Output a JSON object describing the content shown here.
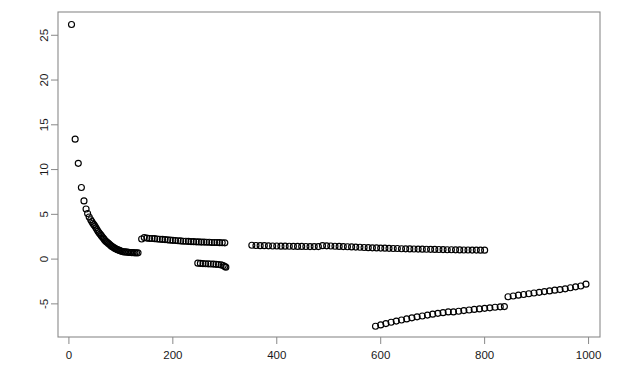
{
  "chart_data": {
    "type": "scatter",
    "title": "",
    "subtitle": "",
    "xlabel": "",
    "ylabel": "",
    "xlim": [
      -21,
      1022
    ],
    "ylim": [
      -8.7,
      27.6
    ],
    "grid": false,
    "legend": null,
    "legend_position": "none",
    "point_style": "open-circle",
    "point_color": "#000000",
    "background_color": "#ffffff",
    "frame_color": "#8a8a8a",
    "xticks": [
      0,
      200,
      400,
      600,
      800,
      1000
    ],
    "xtick_labels": [
      "0",
      "200",
      "400",
      "600",
      "800",
      "1000"
    ],
    "yticks": [
      -5,
      0,
      5,
      10,
      15,
      20,
      25
    ],
    "ytick_labels": [
      "-5",
      "0",
      "5",
      "10",
      "15",
      "20",
      "25"
    ],
    "ytick_label_rotation": -90,
    "series": [
      {
        "name": "decay-branch",
        "x": [
          5,
          12,
          18,
          24,
          29,
          33,
          36,
          39,
          42,
          44,
          46,
          48,
          50,
          52,
          54,
          56,
          58,
          60,
          62,
          64,
          66,
          68,
          70,
          72,
          74,
          76,
          78,
          80,
          82,
          84,
          86,
          88,
          90,
          92,
          94,
          96,
          98,
          100,
          103,
          106,
          109,
          112,
          115,
          118,
          121,
          124,
          127,
          130,
          133
        ],
        "y": [
          26.2,
          13.4,
          10.7,
          8.0,
          6.5,
          5.6,
          5.1,
          4.7,
          4.4,
          4.2,
          4.0,
          3.85,
          3.7,
          3.5,
          3.3,
          3.1,
          2.95,
          2.8,
          2.65,
          2.5,
          2.35,
          2.2,
          2.05,
          1.95,
          1.85,
          1.75,
          1.65,
          1.55,
          1.45,
          1.38,
          1.3,
          1.22,
          1.15,
          1.1,
          1.05,
          1.0,
          0.95,
          0.9,
          0.85,
          0.8,
          0.8,
          0.78,
          0.76,
          0.74,
          0.72,
          0.72,
          0.7,
          0.7,
          0.7
        ]
      },
      {
        "name": "upper-band-mid",
        "x": [
          140,
          145,
          150,
          155,
          160,
          165,
          170,
          175,
          180,
          185,
          190,
          195,
          200,
          205,
          210,
          215,
          220,
          225,
          230,
          235,
          240,
          245,
          250,
          255,
          260,
          265,
          270,
          275,
          280,
          285,
          290,
          295,
          300
        ],
        "y": [
          2.25,
          2.4,
          2.35,
          2.3,
          2.3,
          2.28,
          2.25,
          2.22,
          2.2,
          2.18,
          2.15,
          2.12,
          2.1,
          2.08,
          2.05,
          2.03,
          2.0,
          2.0,
          1.98,
          1.96,
          1.95,
          1.93,
          1.92,
          1.9,
          1.9,
          1.88,
          1.88,
          1.86,
          1.85,
          1.85,
          1.84,
          1.83,
          1.82
        ]
      },
      {
        "name": "dip-segment",
        "x": [
          248,
          253,
          258,
          263,
          268,
          273,
          278,
          283,
          288,
          293,
          297,
          300,
          302
        ],
        "y": [
          -0.45,
          -0.48,
          -0.5,
          -0.52,
          -0.53,
          -0.55,
          -0.56,
          -0.58,
          -0.6,
          -0.65,
          -0.72,
          -0.82,
          -0.9
        ]
      },
      {
        "name": "long-band-right",
        "x": [
          352,
          360,
          368,
          376,
          384,
          392,
          400,
          408,
          416,
          424,
          432,
          440,
          448,
          456,
          464,
          472,
          480,
          488,
          496,
          504,
          512,
          520,
          528,
          536,
          544,
          552,
          560,
          568,
          576,
          584,
          592,
          600,
          608,
          616,
          624,
          632,
          640,
          648,
          656,
          664,
          672,
          680,
          688,
          696,
          704,
          712,
          720,
          728,
          736,
          744,
          752,
          760,
          768,
          776,
          784,
          792,
          800
        ],
        "y": [
          1.55,
          1.52,
          1.5,
          1.5,
          1.48,
          1.47,
          1.46,
          1.45,
          1.45,
          1.44,
          1.43,
          1.42,
          1.42,
          1.41,
          1.4,
          1.4,
          1.4,
          1.5,
          1.48,
          1.46,
          1.44,
          1.42,
          1.4,
          1.38,
          1.36,
          1.34,
          1.32,
          1.3,
          1.28,
          1.26,
          1.25,
          1.23,
          1.22,
          1.2,
          1.19,
          1.18,
          1.16,
          1.15,
          1.14,
          1.13,
          1.12,
          1.11,
          1.1,
          1.09,
          1.08,
          1.07,
          1.06,
          1.05,
          1.05,
          1.04,
          1.03,
          1.02,
          1.02,
          1.01,
          1.01,
          1.0,
          1.0
        ]
      },
      {
        "name": "lower-branch-a",
        "x": [
          590,
          600,
          610,
          620,
          630,
          640,
          650,
          660,
          670,
          680,
          690,
          700,
          710,
          720,
          730,
          740,
          750,
          760,
          770,
          780,
          790,
          800,
          810,
          820,
          830,
          838
        ],
        "y": [
          -7.5,
          -7.35,
          -7.2,
          -7.05,
          -6.92,
          -6.8,
          -6.68,
          -6.56,
          -6.45,
          -6.35,
          -6.25,
          -6.15,
          -6.06,
          -5.98,
          -5.9,
          -5.9,
          -5.82,
          -5.75,
          -5.68,
          -5.62,
          -5.56,
          -5.5,
          -5.44,
          -5.38,
          -5.33,
          -5.3
        ]
      },
      {
        "name": "lower-branch-b",
        "x": [
          845,
          855,
          865,
          875,
          885,
          895,
          905,
          915,
          925,
          935,
          945,
          955,
          965,
          975,
          985,
          995
        ],
        "y": [
          -4.2,
          -4.12,
          -4.03,
          -3.95,
          -3.87,
          -3.79,
          -3.71,
          -3.63,
          -3.55,
          -3.47,
          -3.4,
          -3.32,
          -3.2,
          -3.1,
          -3.0,
          -2.8
        ]
      }
    ]
  },
  "plot_geometry": {
    "frame_left_px": 58,
    "frame_right_px": 600,
    "frame_top_px": 12,
    "frame_bottom_px": 337,
    "point_radius_px": 3.0
  }
}
